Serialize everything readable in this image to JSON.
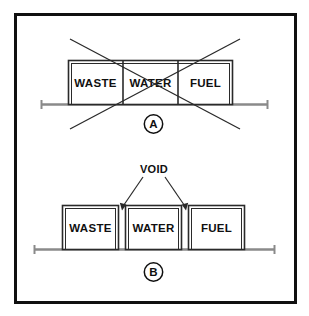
{
  "figure": {
    "border_color": "#101010",
    "line_color": "#2a2a2a",
    "text_color": "#101010",
    "rail_color": "#8a8a8a"
  },
  "panels": [
    {
      "id": "A",
      "letter": "A",
      "status": "rejected",
      "status_marker": "cross-out-x",
      "arrangement": "adjacent-tanks-no-void",
      "tanks": [
        {
          "label": "WASTE"
        },
        {
          "label": "WATER"
        },
        {
          "label": "FUEL"
        }
      ]
    },
    {
      "id": "B",
      "letter": "B",
      "status": "accepted",
      "status_marker": "none",
      "arrangement": "separated-tanks-with-voids",
      "callout": {
        "label": "VOID",
        "arrow_count": 2
      },
      "tanks": [
        {
          "label": "WASTE"
        },
        {
          "label": "WATER"
        },
        {
          "label": "FUEL"
        }
      ]
    }
  ]
}
